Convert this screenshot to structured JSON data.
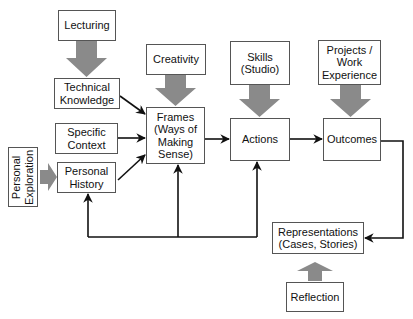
{
  "diagram": {
    "nodes": {
      "lecturing": {
        "label": "Lecturing"
      },
      "technical_knowledge": {
        "label": "Technical\nKnowledge"
      },
      "specific_context": {
        "label": "Specific\nContext"
      },
      "personal_history": {
        "label": "Personal\nHistory"
      },
      "personal_exploration": {
        "label": "Personal\nExploration"
      },
      "creativity": {
        "label": "Creativity"
      },
      "frames": {
        "label": "Frames\n(Ways of\nMaking\nSense)"
      },
      "skills": {
        "label": "Skills\n(Studio)"
      },
      "actions": {
        "label": "Actions"
      },
      "projects": {
        "label": "Projects /\nWork\nExperience"
      },
      "outcomes": {
        "label": "Outcomes"
      },
      "representations": {
        "label": "Representations\n(Cases, Stories)"
      },
      "reflection": {
        "label": "Reflection"
      }
    },
    "edges": [
      {
        "from": "lecturing",
        "to": "technical_knowledge",
        "style": "thick-gray"
      },
      {
        "from": "creativity",
        "to": "frames",
        "style": "thick-gray"
      },
      {
        "from": "skills",
        "to": "actions",
        "style": "thick-gray"
      },
      {
        "from": "projects",
        "to": "outcomes",
        "style": "thick-gray"
      },
      {
        "from": "personal_exploration",
        "to": "personal_history",
        "style": "thick-gray"
      },
      {
        "from": "reflection",
        "to": "representations",
        "style": "thick-gray"
      },
      {
        "from": "technical_knowledge",
        "to": "frames",
        "style": "thin-black"
      },
      {
        "from": "specific_context",
        "to": "frames",
        "style": "thin-black"
      },
      {
        "from": "personal_history",
        "to": "frames",
        "style": "thin-black"
      },
      {
        "from": "frames",
        "to": "actions",
        "style": "thin-black"
      },
      {
        "from": "actions",
        "to": "outcomes",
        "style": "thin-black"
      },
      {
        "from": "outcomes",
        "to": "representations",
        "style": "thin-black"
      },
      {
        "from": "loop",
        "to": "personal_history",
        "style": "thin-black"
      },
      {
        "from": "loop",
        "to": "frames",
        "style": "thin-black"
      },
      {
        "from": "loop",
        "to": "actions",
        "style": "thin-black"
      }
    ],
    "colors": {
      "thick_arrow": "#8a8a8a",
      "thin_arrow": "#111111",
      "box_border": "#555555"
    }
  }
}
